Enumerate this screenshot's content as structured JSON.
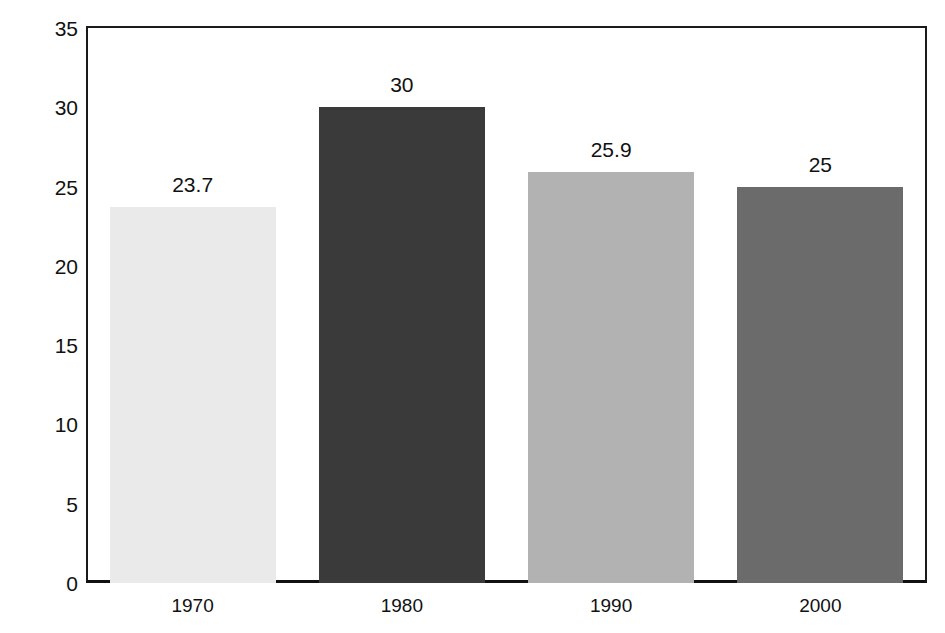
{
  "chart_data": {
    "type": "bar",
    "title": "",
    "xlabel": "",
    "ylabel": "Population (millions)",
    "categories": [
      "1970",
      "1980",
      "1990",
      "2000"
    ],
    "values": [
      23.7,
      30,
      25.9,
      25
    ],
    "value_labels": [
      "23.7",
      "30",
      "25.9",
      "25"
    ],
    "ylim": [
      0,
      35
    ],
    "ytick_labels": [
      "0",
      "5",
      "10",
      "15",
      "20",
      "25",
      "30",
      "35"
    ],
    "ytick_values": [
      0,
      5,
      10,
      15,
      20,
      25,
      30,
      35
    ],
    "grid": false,
    "legend": "none",
    "bar_colors": [
      "#EAEAEA",
      "#3A3A3A",
      "#B2B2B2",
      "#6B6B6B"
    ],
    "frame_color": "#111111",
    "background_color": "#FFFFFF",
    "series": [
      {
        "name": "Population",
        "values": [
          23.7,
          30,
          25.9,
          25
        ]
      }
    ]
  }
}
